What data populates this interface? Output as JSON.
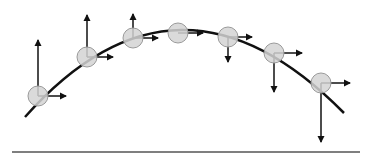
{
  "diagram": {
    "colors": {
      "background": "#ffffff",
      "trajectory": "#111111",
      "ball_fill": "#d4d4d4",
      "ball_stroke": "#9a9a9a",
      "arrow": "#111111",
      "ground": "#555555"
    },
    "ground": {
      "x1": 12,
      "x2": 360,
      "y": 152
    },
    "trajectory": {
      "path": "M 25 117 Q 178 -55 344 113"
    },
    "balls": [
      {
        "cx": 38,
        "cy": 96,
        "r": 10,
        "vx_tip": 66,
        "vy_tip": 40
      },
      {
        "cx": 87,
        "cy": 57,
        "r": 10,
        "vx_tip": 113,
        "vy_tip": 15
      },
      {
        "cx": 133,
        "cy": 38,
        "r": 10,
        "vx_tip": 158,
        "vy_tip": 14
      },
      {
        "cx": 178,
        "cy": 33,
        "r": 10,
        "vx_tip": 203,
        "vy_tip": null
      },
      {
        "cx": 228,
        "cy": 37,
        "r": 10,
        "vx_tip": 252,
        "vy_tip": 62
      },
      {
        "cx": 274,
        "cy": 53,
        "r": 10,
        "vx_tip": 302,
        "vy_tip": 92
      },
      {
        "cx": 321,
        "cy": 83,
        "r": 10,
        "vx_tip": 350,
        "vy_tip": 142
      }
    ]
  }
}
